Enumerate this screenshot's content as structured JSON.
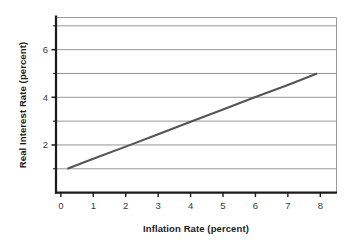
{
  "figure": {
    "background_color": "#ffffff",
    "plot_background_color": "#ffffff"
  },
  "chart_data": {
    "type": "line",
    "title": "",
    "subtitle": "",
    "xlabel": "Inflation Rate (percent)",
    "ylabel": "Real Interest Rate (percent)",
    "xlim": [
      -0.15,
      8.5
    ],
    "ylim": [
      0,
      7.35
    ],
    "x_ticks": [
      0,
      1,
      2,
      3,
      4,
      5,
      6,
      7,
      8
    ],
    "x_tick_labels": [
      "0",
      "1",
      "2",
      "3",
      "4",
      "5",
      "6",
      "7",
      "8"
    ],
    "y_ticks": [
      1,
      2,
      3,
      4,
      5,
      6,
      7
    ],
    "y_tick_labels": [
      "",
      "2",
      "",
      "4",
      "",
      "6",
      ""
    ],
    "y_labeled_ticks": [
      2,
      4,
      6
    ],
    "grid": {
      "horizontal": true,
      "vertical": false,
      "color": "#8a8a8a",
      "position": "behind-data"
    },
    "legend": null,
    "series": [
      {
        "name": "Real interest rate",
        "color": "#555555",
        "line_width": 2.1,
        "style": "solid",
        "x": [
          0.2,
          7.9
        ],
        "y": [
          1.0,
          5.0
        ],
        "points": [
          {
            "x": 0.2,
            "y": 1.0
          },
          {
            "x": 1.0,
            "y": 1.42
          },
          {
            "x": 2.0,
            "y": 1.93
          },
          {
            "x": 3.0,
            "y": 2.45
          },
          {
            "x": 4.0,
            "y": 2.97
          },
          {
            "x": 5.0,
            "y": 3.49
          },
          {
            "x": 6.0,
            "y": 4.01
          },
          {
            "x": 7.0,
            "y": 4.52
          },
          {
            "x": 7.9,
            "y": 5.0
          }
        ],
        "slope": 0.52,
        "intercept": 0.9
      }
    ],
    "annotations": []
  },
  "axes": {
    "left_spine_color": "#1a1a1a",
    "bottom_spine_color": "#1a1a1a",
    "top_spine_color": "#9a9a9a",
    "right_spine_color": "#9a9a9a",
    "tick_color": "#1a1a1a"
  }
}
